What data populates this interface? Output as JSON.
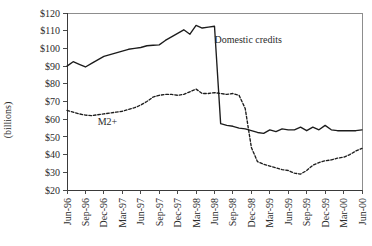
{
  "chart_data": {
    "type": "line",
    "title": "",
    "subtitle": "",
    "xlabel": "",
    "ylabel": "(billions)",
    "ylim": [
      20,
      120
    ],
    "ytick_labels": [
      "$120",
      "$110",
      "$100",
      "$90",
      "$80",
      "$70",
      "$60",
      "$50",
      "$40",
      "$30",
      "$20"
    ],
    "ytick_values": [
      120,
      110,
      100,
      90,
      80,
      70,
      60,
      50,
      40,
      30,
      20
    ],
    "grid": false,
    "legend_position": "inline-annotations",
    "categories": [
      "Jun-96",
      "Jul-96",
      "Aug-96",
      "Sep-96",
      "Oct-96",
      "Nov-96",
      "Dec-96",
      "Jan-97",
      "Feb-97",
      "Mar-97",
      "Apr-97",
      "May-97",
      "Jun-97",
      "Jul-97",
      "Aug-97",
      "Sep-97",
      "Oct-97",
      "Nov-97",
      "Dec-97",
      "Jan-98",
      "Feb-98",
      "Mar-98",
      "Apr-98",
      "May-98",
      "Jun-98",
      "Jul-98",
      "Aug-98",
      "Sep-98",
      "Oct-98",
      "Nov-98",
      "Dec-98",
      "Jan-99",
      "Feb-99",
      "Mar-99",
      "Apr-99",
      "May-99",
      "Jun-99",
      "Jul-99",
      "Aug-99",
      "Sep-99",
      "Oct-99",
      "Nov-99",
      "Dec-99",
      "Jan-00",
      "Feb-00",
      "Mar-00",
      "Apr-00",
      "May-00",
      "Jun-00"
    ],
    "xtick_labels": [
      "Jun-96",
      "Sep-96",
      "Dec-96",
      "Mar-97",
      "Jun-97",
      "Sep-97",
      "Dec-97",
      "Mar-98",
      "Jun-98",
      "Sep-98",
      "Dec-98",
      "Mar-99",
      "Jun-99",
      "Sep-99",
      "Dec-99",
      "Mar-00",
      "Jun-00"
    ],
    "series": [
      {
        "name": "Domestic credits",
        "style": "solid",
        "label_text": "Domestic credits",
        "values": [
          90.0,
          92.5,
          91.0,
          89.5,
          91.5,
          93.5,
          95.5,
          96.5,
          97.5,
          98.5,
          99.5,
          100.0,
          100.5,
          101.5,
          101.8,
          102.0,
          104.5,
          106.5,
          108.5,
          110.5,
          108.0,
          113.0,
          111.5,
          112.0,
          112.5,
          57.5,
          56.5,
          56.0,
          55.0,
          54.5,
          53.5,
          52.5,
          52.0,
          54.0,
          53.0,
          54.5,
          54.0,
          54.0,
          55.5,
          53.5,
          55.5,
          54.0,
          56.5,
          54.0,
          53.5,
          53.5,
          53.5,
          53.5,
          54.0
        ]
      },
      {
        "name": "M2+",
        "style": "dashed",
        "label_text": "M2+",
        "values": [
          65.0,
          64.0,
          63.0,
          62.3,
          62.0,
          62.5,
          63.0,
          63.5,
          64.0,
          64.5,
          65.5,
          66.5,
          68.0,
          70.0,
          72.5,
          73.5,
          74.0,
          74.0,
          73.5,
          74.0,
          75.5,
          77.0,
          74.5,
          74.5,
          75.0,
          74.5,
          74.0,
          74.5,
          73.5,
          66.0,
          44.0,
          36.0,
          34.5,
          33.5,
          32.5,
          31.5,
          31.0,
          29.5,
          29.0,
          31.0,
          34.0,
          35.5,
          36.5,
          37.0,
          38.0,
          38.5,
          40.0,
          42.0,
          43.5
        ]
      }
    ],
    "annotations": [
      {
        "text": "Domestic credits",
        "x_category": "Jun-98",
        "y_value": 103
      },
      {
        "text": "M2+",
        "x_category": "Nov-96",
        "y_value": 57
      }
    ]
  }
}
